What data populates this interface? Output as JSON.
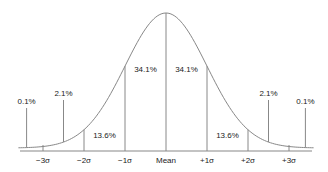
{
  "diagram": {
    "axis_labels": [
      "−3σ",
      "−2σ",
      "−1σ",
      "Mean",
      "+1σ",
      "+2σ",
      "+3σ"
    ],
    "axis_sigma": [
      -3,
      -2,
      -1,
      0,
      1,
      2,
      3
    ],
    "regions": [
      {
        "label": "0.1%",
        "sigma": -3.4,
        "label_row": "low"
      },
      {
        "label": "2.1%",
        "sigma": -2.5,
        "label_row": "mid"
      },
      {
        "label": "13.6%",
        "sigma": -1.5,
        "label_row": "inner"
      },
      {
        "label": "34.1%",
        "sigma": -0.5,
        "label_row": "top"
      },
      {
        "label": "34.1%",
        "sigma": 0.5,
        "label_row": "top"
      },
      {
        "label": "13.6%",
        "sigma": 1.5,
        "label_row": "inner"
      },
      {
        "label": "2.1%",
        "sigma": 2.5,
        "label_row": "mid"
      },
      {
        "label": "0.1%",
        "sigma": 3.4,
        "label_row": "low"
      }
    ],
    "line_color": "#888888",
    "text_color": "#222222"
  }
}
